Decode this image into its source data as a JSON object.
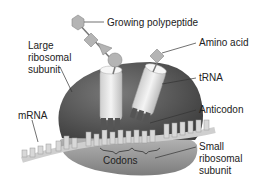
{
  "diagram": {
    "labels": {
      "growing_polypeptide": "Growing polypeptide",
      "amino_acid": "Amino acid",
      "large_subunit_1": "Large",
      "large_subunit_2": "ribosomal",
      "large_subunit_3": "subunit",
      "trna": "tRNA",
      "mrna": "mRNA",
      "anticodon": "Anticodon",
      "codons": "Codons",
      "small_subunit_1": "Small",
      "small_subunit_2": "ribosomal",
      "small_subunit_3": "subunit"
    },
    "colors": {
      "large_subunit": "#5e5e5e",
      "small_subunit": "#8c8c8c",
      "trna": "#e6e6e6",
      "amino_acid": "#b4b4b4",
      "mrna": "#cfcfcf",
      "leader_line": "#333333"
    }
  }
}
